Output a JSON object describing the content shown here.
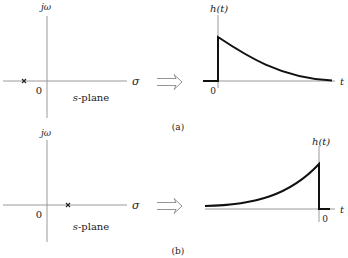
{
  "panels": [
    {
      "id": "a",
      "caption": "(a)",
      "splane": {
        "vertical_axis_label": "jω",
        "horizontal_axis_label": "σ",
        "origin_label": "0",
        "plane_label": "s-plane",
        "pole_marker": "×",
        "pole_position": "left half-plane (negative real)"
      },
      "arrow": "⇒",
      "response": {
        "y_label": "h(t)",
        "x_label": "t",
        "origin_label": "0",
        "shape": "causal decaying exponential (jump at t=0, decays for t>0)"
      }
    },
    {
      "id": "b",
      "caption": "(b)",
      "splane": {
        "vertical_axis_label": "jω",
        "horizontal_axis_label": "σ",
        "origin_label": "0",
        "plane_label": "s-plane",
        "pole_marker": "×",
        "pole_position": "right half-plane (positive real)"
      },
      "arrow": "⇒",
      "response": {
        "y_label": "h(t)",
        "x_label": "t",
        "origin_label": "0",
        "shape": "anti-causal growing exponential (rises for t<0, drops to zero at t=0)"
      }
    }
  ],
  "colors": {
    "axis": "#9a9a9a",
    "curve": "#111111",
    "text": "#222222"
  }
}
